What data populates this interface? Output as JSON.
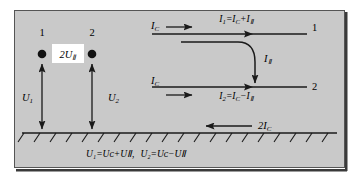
{
  "figure": {
    "background_color": "#c9c9c9",
    "line_color": "#1a1a1a",
    "label_box_color": "#ffffff",
    "type": "circuit-diagram"
  },
  "left_section": {
    "terminal_1_label": "1",
    "terminal_2_label": "2",
    "center_box_label": "2U Ⅱ",
    "center_box_main": "2U",
    "center_box_sub": "Ⅱ",
    "voltage_1_main": "U",
    "voltage_1_sub": "1",
    "voltage_2_main": "U",
    "voltage_2_sub": "2"
  },
  "right_section": {
    "top_source_main": "I",
    "top_source_sub": "C",
    "top_equation": "I₁=Iᴄ+IⅡ",
    "top_eq_parts": [
      "I",
      "1",
      "=",
      "I",
      "C",
      "+",
      "I",
      "Ⅱ"
    ],
    "top_end_label": "1",
    "middle_curve_main": "I",
    "middle_curve_sub": "Ⅱ",
    "bottom_source_main": "I",
    "bottom_source_sub": "C",
    "bottom_equation": "I₂=Iᴄ−IⅡ",
    "bottom_eq_parts": [
      "I",
      "2",
      "=",
      "I",
      "C",
      "−",
      "I",
      "Ⅱ"
    ],
    "bottom_end_label": "2"
  },
  "ground_section": {
    "return_current_main": "2I",
    "return_current_sub": "C",
    "hatch_count": 20
  },
  "caption": {
    "full": "U₁=Uᴄ+UⅡ,  U₂=Uᴄ−UⅡ",
    "first_eq": "U₁=Uᴄ+UⅡ",
    "separator": ",",
    "second_eq": "U₂=Uᴄ−UⅡ"
  }
}
